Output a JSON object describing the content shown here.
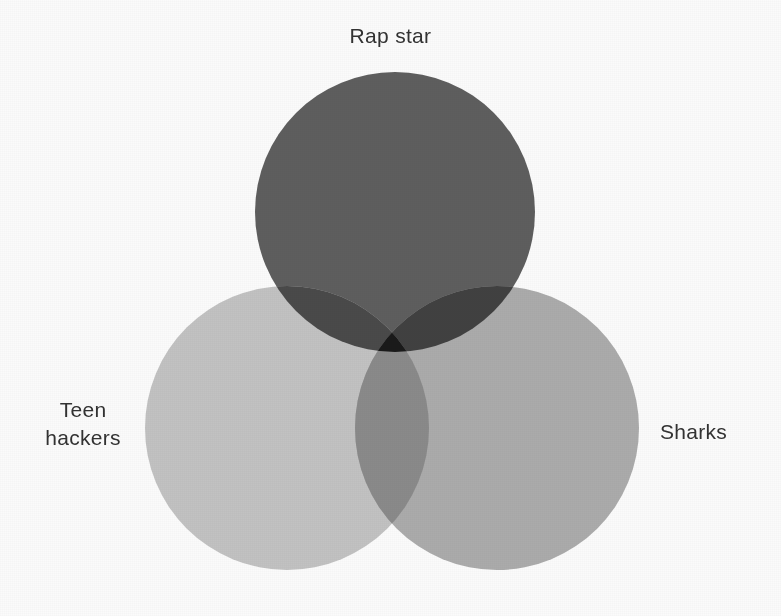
{
  "diagram": {
    "type": "venn",
    "set_count": 3,
    "background_color": "#fbfbfb",
    "text_color": "#323232",
    "canvas": {
      "width": 781,
      "height": 616
    },
    "sets": [
      {
        "id": "rap-star",
        "label": "Rap star",
        "position": "top",
        "color": "#5e5e5e",
        "cx": 395,
        "cy": 212,
        "r": 140,
        "label_x": 390,
        "label_y": 22
      },
      {
        "id": "teen-hackers",
        "label": "Teen\nhackers",
        "position": "bottom-left",
        "color": "#c2c2c2",
        "cx": 287,
        "cy": 428,
        "r": 142,
        "label_x": 83,
        "label_y": 425
      },
      {
        "id": "sharks",
        "label": "Sharks",
        "position": "bottom-right",
        "color": "#ababab",
        "cx": 497,
        "cy": 428,
        "r": 142,
        "label_x": 705,
        "label_y": 431
      }
    ],
    "intersections": [
      {
        "id": "rap-star-teen-hackers",
        "color": "#4a4a4a"
      },
      {
        "id": "rap-star-sharks",
        "color": "#414141"
      },
      {
        "id": "teen-hackers-sharks",
        "color": "#8a8a8a"
      },
      {
        "id": "rap-star-teen-hackers-sharks",
        "color": "#1a1a1a"
      }
    ]
  }
}
